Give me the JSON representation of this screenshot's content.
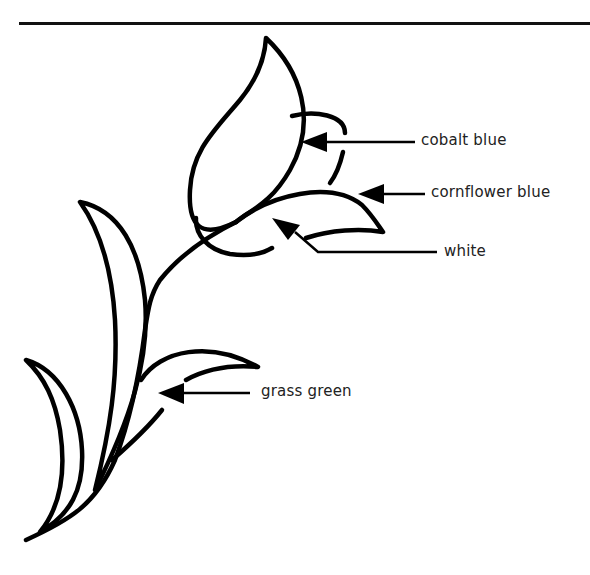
{
  "figure": {
    "type": "labeled line drawing",
    "labels": [
      {
        "id": "cobalt",
        "text": "cobalt blue",
        "target": "back petal"
      },
      {
        "id": "cornflower",
        "text": "cornflower blue",
        "target": "front petal outer edge"
      },
      {
        "id": "white",
        "text": "white",
        "target": "front petal inner area"
      },
      {
        "id": "grass",
        "text": "grass green",
        "target": "leaves"
      }
    ]
  },
  "colors": {
    "line": "#000000",
    "background": "#ffffff",
    "text": "#222222"
  }
}
